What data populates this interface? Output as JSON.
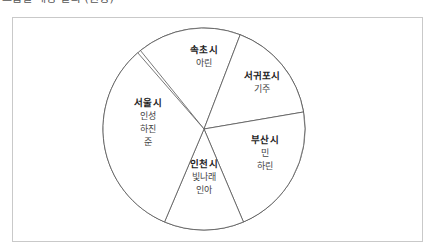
{
  "caption": {
    "text": "그룹별 배정 결과 (원형)"
  },
  "chart_data": {
    "type": "pie",
    "title": "",
    "legend_position": "inside-slices",
    "grid": false,
    "center": {
      "x": 204,
      "y": 129
    },
    "radius": 101,
    "categories": [
      "속초시",
      "서귀포시",
      "부산시",
      "인천시",
      "서울시"
    ],
    "values": [
      60,
      60,
      77,
      48,
      117
    ],
    "unit": "degrees",
    "slices": [
      {
        "label": "속초시",
        "members": [
          "아린"
        ],
        "value": 60,
        "start_angle_deg": 69,
        "end_angle_deg": 129,
        "label_x": 204,
        "label_y": 56
      },
      {
        "label": "서귀포시",
        "members": [
          "기주"
        ],
        "value": 60,
        "start_angle_deg": 9.7,
        "end_angle_deg": 69,
        "label_x": 262,
        "label_y": 82
      },
      {
        "label": "부산시",
        "members": [
          "민",
          "하린"
        ],
        "value": 77,
        "start_angle_deg": -67,
        "end_angle_deg": 9.7,
        "label_x": 265,
        "label_y": 153
      },
      {
        "label": "인천시",
        "members": [
          "빛나래",
          "인아"
        ],
        "value": 48,
        "start_angle_deg": -113,
        "end_angle_deg": -67,
        "label_x": 204,
        "label_y": 177
      },
      {
        "label": "서울시",
        "members": [
          "인성",
          "하진",
          "준"
        ],
        "value": 117,
        "start_angle_deg": -229,
        "end_angle_deg": -113,
        "label_x": 148,
        "label_y": 122
      }
    ]
  },
  "style": {
    "stroke": "#555555",
    "fill": "#ffffff",
    "panel_border": "#c9c9c9"
  }
}
